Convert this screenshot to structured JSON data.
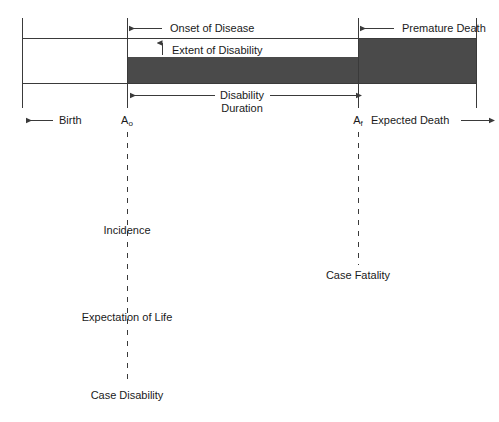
{
  "figure": {
    "type": "conceptual-timeline-diagram",
    "topic": "Natural history of disease: disability and mortality timeline",
    "background_color": "#ffffff",
    "line_color": "#3a3a3a",
    "fill_color": "#4a4a4a",
    "text_color": "#1a1a1a"
  },
  "axis": {
    "start_label": "Birth",
    "start_arrow": "left",
    "end_label": "Expected Death",
    "end_arrow": "right",
    "markers": [
      {
        "id": "a0",
        "label": "A",
        "subscript": "o",
        "x": 127
      },
      {
        "id": "af",
        "label": "A",
        "subscript": "f",
        "x": 358
      }
    ]
  },
  "annotations": {
    "onset": {
      "label": "Onset of Disease",
      "arrow": "left"
    },
    "extent": {
      "label": "Extent of Disability",
      "arrow": "up"
    },
    "premature": {
      "label": "Premature Death",
      "arrow": "left"
    },
    "duration": {
      "line1": "Disability",
      "line2": "Duration",
      "arrow": "both"
    }
  },
  "measures": [
    {
      "id": "incidence",
      "label": "Incidence",
      "marker": "a0",
      "y": 230
    },
    {
      "id": "case-fatality",
      "label": "Case Fatality",
      "marker": "af",
      "y": 275
    },
    {
      "id": "expectation-of-life",
      "label": "Expectation of Life",
      "marker": "a0",
      "y": 317
    },
    {
      "id": "case-disability",
      "label": "Case Disability",
      "marker": "a0",
      "y": 395
    }
  ]
}
